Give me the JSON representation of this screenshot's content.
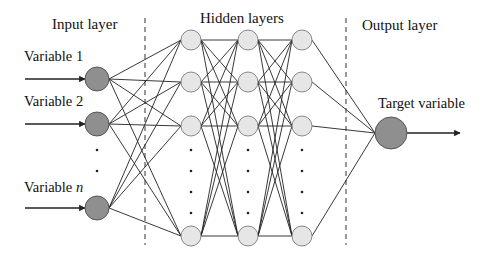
{
  "diagram": {
    "sections": {
      "input": "Input layer",
      "hidden": "Hidden layers",
      "output": "Output layer"
    },
    "inputs": [
      {
        "label": "Variable 1",
        "y": 79
      },
      {
        "label": "Variable 2",
        "y": 124
      },
      {
        "label": "Variable ",
        "label_italic": "n",
        "y": 208
      }
    ],
    "hidden_columns_x": [
      191,
      248,
      302
    ],
    "hidden_rows_y": [
      40,
      82,
      126,
      236
    ],
    "output": {
      "label": "Target variable",
      "x": 391,
      "y": 133
    },
    "dividers_x": [
      145,
      346
    ],
    "colors": {
      "input_node": "#8f8f8f",
      "hidden_node": "#e6e6e6",
      "output_node": "#8f8f8f",
      "edge": "#222222",
      "divider": "#333333"
    },
    "ellipsis": "⋮"
  }
}
